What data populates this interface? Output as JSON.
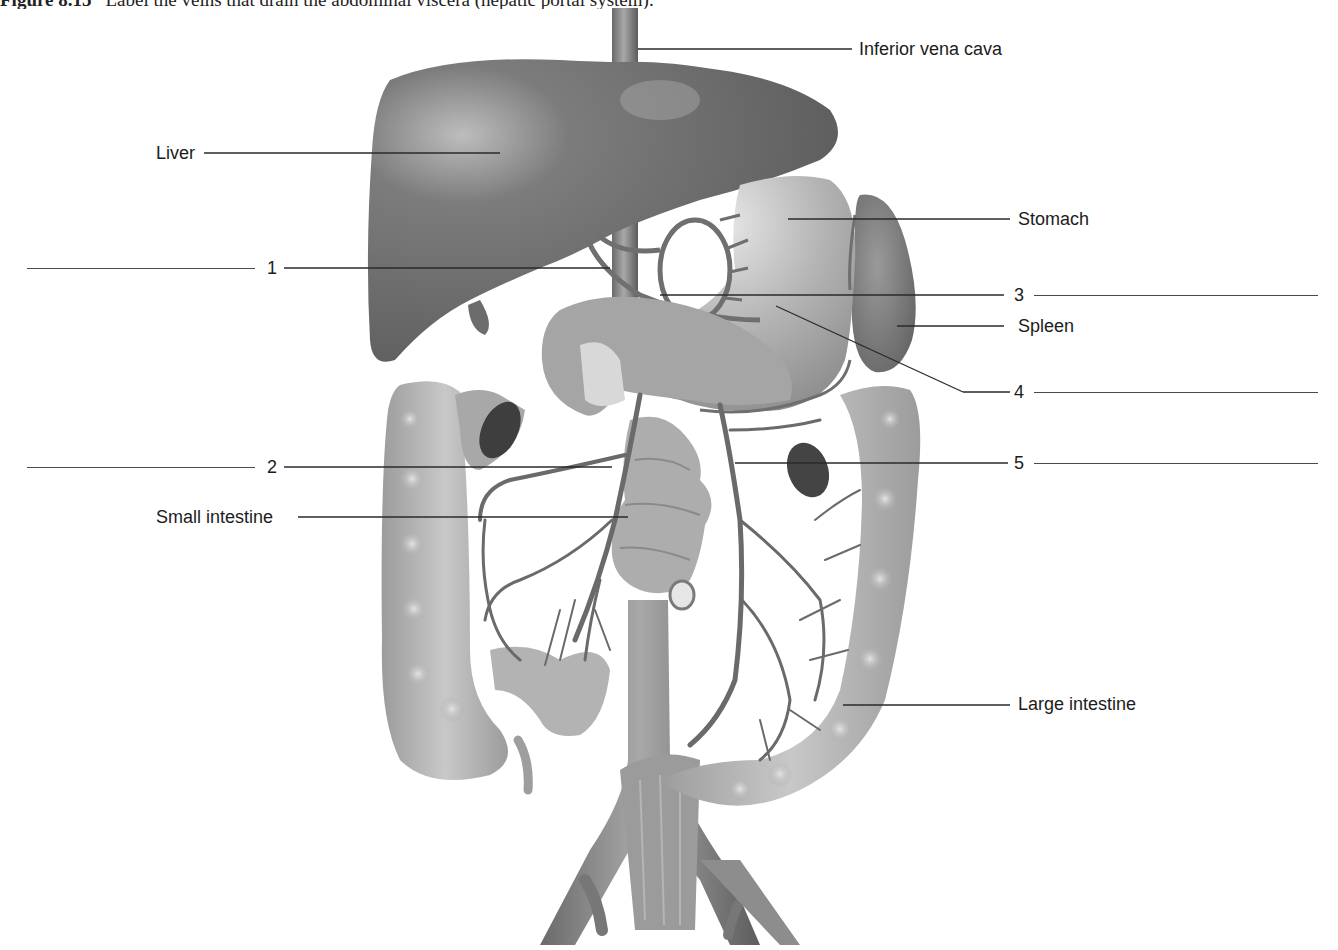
{
  "caption": {
    "figure_no": "Figure 8.15",
    "text": "Label the veins that drain the abdominal viscera (hepatic portal system)."
  },
  "labels": {
    "ivc": "Inferior vena cava",
    "liver": "Liver",
    "stomach": "Stomach",
    "spleen": "Spleen",
    "small_intestine": "Small intestine",
    "large_intestine": "Large intestine"
  },
  "blanks": [
    {
      "number": "1",
      "side": "left"
    },
    {
      "number": "2",
      "side": "left"
    },
    {
      "number": "3",
      "side": "right"
    },
    {
      "number": "4",
      "side": "right"
    },
    {
      "number": "5",
      "side": "right"
    }
  ],
  "colors": {
    "leader_line": "#2a2a2a",
    "organ_dark": "#6e6e6e",
    "organ_mid": "#9a9a9a",
    "organ_light": "#c4c4c4",
    "background": "#ffffff"
  }
}
